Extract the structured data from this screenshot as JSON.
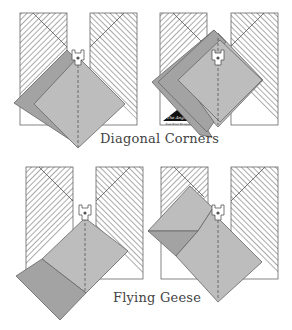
{
  "figure": {
    "captions": {
      "diagonal_corners": "Diagonal Corners",
      "flying_geese": "Flying Geese"
    },
    "logo": {
      "title": "The Angler",
      "subtitle": "Pam Bono Designs"
    },
    "colors": {
      "hatch_line": "#555555",
      "outline": "#666666",
      "fabric_light": "#bdbdbd",
      "fabric_dark": "#a3a3a3",
      "presser_foot": "#ffffff",
      "seam_line": "#555555"
    },
    "panels": [
      {
        "id": "diagonal-corners-step-1",
        "section": "Diagonal Corners"
      },
      {
        "id": "diagonal-corners-step-2",
        "section": "Diagonal Corners"
      },
      {
        "id": "flying-geese-step-1",
        "section": "Flying Geese"
      },
      {
        "id": "flying-geese-step-2",
        "section": "Flying Geese"
      }
    ]
  }
}
